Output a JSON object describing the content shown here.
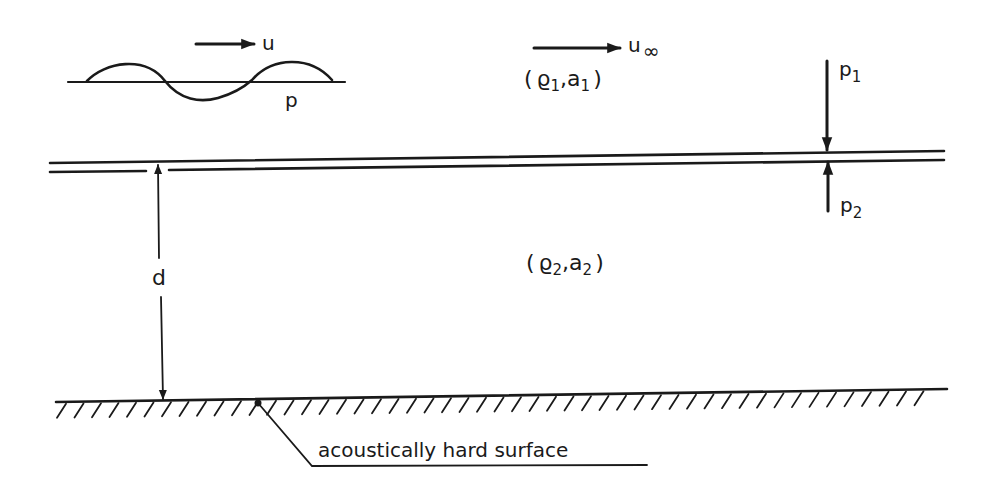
{
  "diagram": {
    "type": "schematic",
    "wave_inset": {
      "velocity_label": "u",
      "pressure_label": "p"
    },
    "upper_medium": {
      "flow_label": "u",
      "flow_subscript": "∞",
      "properties_label": "(ϱ1, a1)",
      "rho_symbol": "ϱ",
      "rho_sub": "1",
      "a_symbol": "a",
      "a_sub": "1"
    },
    "lower_medium": {
      "properties_label": "(ϱ2, a2)",
      "rho_symbol": "ϱ",
      "rho_sub": "2",
      "a_symbol": "a",
      "a_sub": "2"
    },
    "pressures": {
      "top": {
        "symbol": "p",
        "sub": "1"
      },
      "bottom": {
        "symbol": "p",
        "sub": "2"
      }
    },
    "gap": {
      "label": "d"
    },
    "surface": {
      "label": "acoustically hard surface"
    },
    "colors": {
      "ink": "#1a1a1a",
      "background": "#ffffff"
    }
  }
}
